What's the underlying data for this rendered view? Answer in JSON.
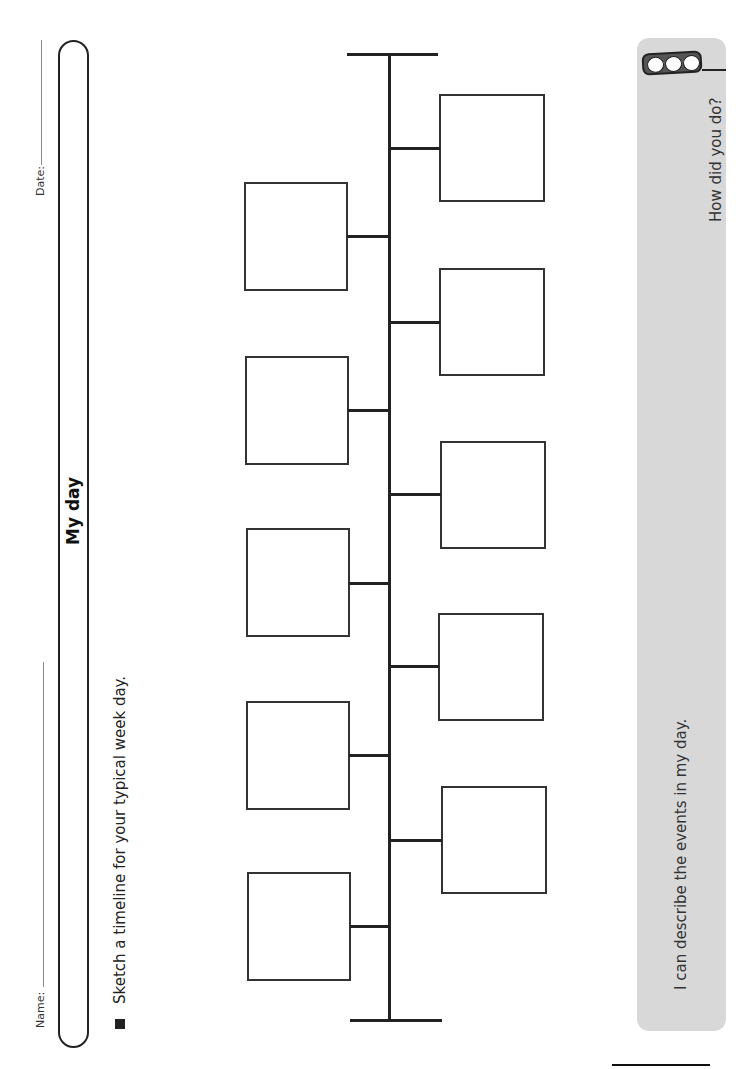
{
  "header": {
    "date_label": "Date:",
    "name_label": "Name:"
  },
  "title": "My day",
  "instruction": "Sketch a timeline for your typical week day.",
  "timeline": {
    "left_boxes": 5,
    "right_boxes": 5
  },
  "self_assessment": {
    "statement": "I can describe the events in my day.",
    "prompt": "How did you do?",
    "icon": "traffic-light-icon",
    "colors": {
      "panel": "#d8d8d8",
      "housing": "#555555"
    }
  }
}
